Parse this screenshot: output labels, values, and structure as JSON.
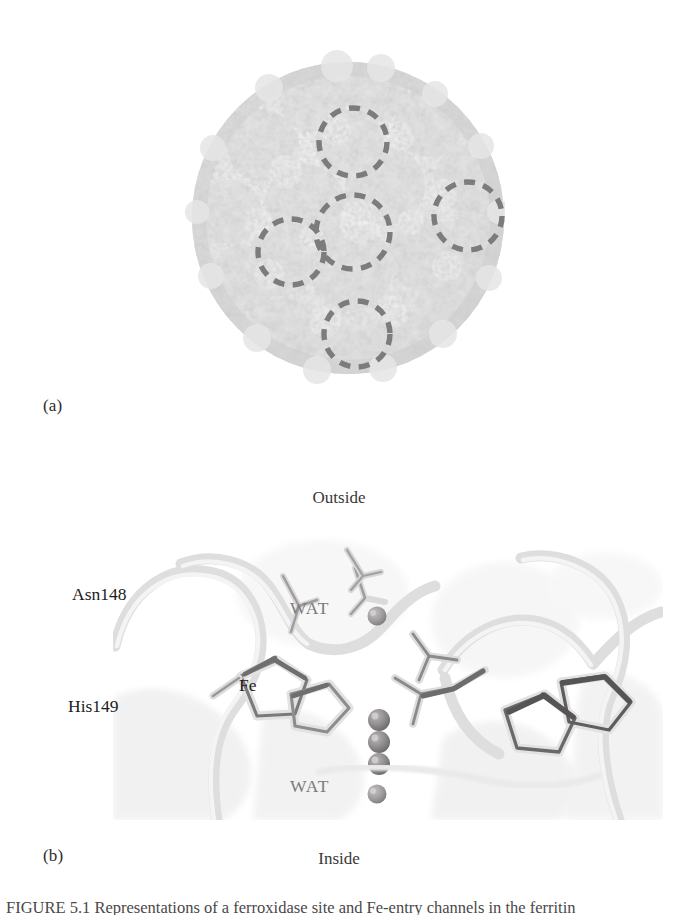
{
  "figure": {
    "panel_a": {
      "label": "(a)",
      "subject": "ferritin-protein-shell-surface",
      "highlight_marker": "dashed-circle",
      "highlight_count": 5,
      "highlight_label": "ferroxidase site",
      "marker_color": "#7d7b7b",
      "surface_color": "#d9d9d9"
    },
    "panel_b": {
      "label": "(b)",
      "subject": "ferroxidase-active-site-close-up",
      "orientation_top": "Outside",
      "orientation_bottom": "Inside",
      "residues": [
        {
          "name": "Asn148"
        },
        {
          "name": "His149"
        }
      ],
      "metal_label": "Fe",
      "metal_count": 3,
      "metal_color": "#8d8b8b",
      "waters": [
        {
          "name": "WAT",
          "position": "upper"
        },
        {
          "name": "WAT",
          "position": "lower"
        }
      ],
      "water_color": "#9b9999",
      "ribbon_color": "#e3e3e3"
    },
    "caption": {
      "text": "FIGURE 5.1   Representations of a ferroxidase site and Fe-entry channels in the ferritin"
    }
  }
}
